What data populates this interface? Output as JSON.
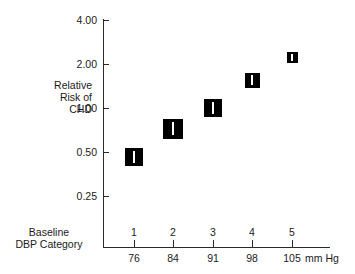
{
  "figure": {
    "title_partial": "",
    "y_axis_label": [
      "Relative",
      "Risk of",
      "CHD"
    ],
    "x_axis_label": [
      "Baseline",
      "DBP Category"
    ],
    "x_unit": "mm Hg"
  },
  "chart_data": {
    "type": "scatter",
    "title": "",
    "xlabel": "Baseline DBP Category",
    "ylabel": "Relative Risk of CHD",
    "x_unit": "mm Hg",
    "yscale": "log",
    "ylim": [
      0.2,
      4.6
    ],
    "grid": false,
    "legend": null,
    "ytick_labels": [
      "4.00",
      "2.00",
      "1.00",
      "0.50",
      "0.25"
    ],
    "ytick_values": [
      4.0,
      2.0,
      1.0,
      0.5,
      0.25
    ],
    "categories": [
      "1",
      "2",
      "3",
      "4",
      "5"
    ],
    "x_tick_labels": [
      "76",
      "84",
      "91",
      "98",
      "105"
    ],
    "x_values_mmhg": [
      76,
      84,
      91,
      98,
      105
    ],
    "values": [
      0.46,
      0.72,
      1.0,
      1.55,
      2.2
    ],
    "marker_style": "filled-square-with-white-ci-bar",
    "points": [
      {
        "category": "1",
        "dbp_mm_hg": 76,
        "relative_risk": 0.46,
        "marker_size_px": 18,
        "ci_bar_height_px": 12
      },
      {
        "category": "2",
        "dbp_mm_hg": 84,
        "relative_risk": 0.72,
        "marker_size_px": 20,
        "ci_bar_height_px": 13
      },
      {
        "category": "3",
        "dbp_mm_hg": 91,
        "relative_risk": 1.0,
        "marker_size_px": 18,
        "ci_bar_height_px": 12
      },
      {
        "category": "4",
        "dbp_mm_hg": 98,
        "relative_risk": 1.55,
        "marker_size_px": 15,
        "ci_bar_height_px": 10
      },
      {
        "category": "5",
        "dbp_mm_hg": 105,
        "relative_risk": 2.2,
        "marker_size_px": 11,
        "ci_bar_height_px": 7
      }
    ]
  },
  "colors": {
    "marker": "#000000",
    "ci_bar": "#ffffff",
    "axis": "#2b2b2b",
    "background": "#ffffff",
    "text": "#1a1a1a"
  }
}
